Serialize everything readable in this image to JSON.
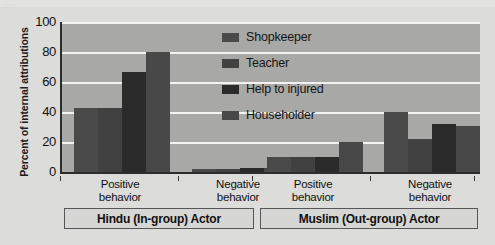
{
  "top_caption_fragment": "     ,       ,            ,                      ",
  "axis": {
    "y_title": "Percent of internal attributions",
    "y_ticks": [
      "100",
      "80",
      "60",
      "40",
      "20",
      "0"
    ]
  },
  "legend": {
    "items": [
      {
        "label": "Shopkeeper",
        "color": "#4a4a4a"
      },
      {
        "label": "Teacher",
        "color": "#414141"
      },
      {
        "label": "Help to injured",
        "color": "#2b2b2b"
      },
      {
        "label": "Householder",
        "color": "#484848"
      }
    ]
  },
  "groups": [
    {
      "name": "Hindu (In-group) Actor",
      "categories": [
        "Positive|behavior",
        "Negative|behavior"
      ]
    },
    {
      "name": "Muslim (Out-group) Actor",
      "categories": [
        "Positive|behavior",
        "Negative|behavior"
      ]
    }
  ],
  "x_category_labels": [
    {
      "line1": "Positive",
      "line2": "behavior"
    },
    {
      "line1": "Negative",
      "line2": "behavior"
    },
    {
      "line1": "Positive",
      "line2": "behavior"
    },
    {
      "line1": "Negative",
      "line2": "behavior"
    }
  ],
  "group_box_labels": [
    "Hindu (In-group) Actor",
    "Muslim (Out-group) Actor"
  ],
  "colors": {
    "plot_background": "#a8a8a6",
    "figure_background": "#dcdcda",
    "gridline": "#f3f3f1",
    "axis_line": "#2c2c2c",
    "text": "#111111"
  },
  "chart_data": {
    "type": "bar",
    "title": "",
    "xlabel": "",
    "ylabel": "Percent of internal attributions",
    "ylim": [
      0,
      100
    ],
    "yticks": [
      0,
      20,
      40,
      60,
      80,
      100
    ],
    "grid": true,
    "legend_position": "inside-top-center",
    "categories": [
      "Hindu (In-group) Actor / Positive behavior",
      "Hindu (In-group) Actor / Negative behavior",
      "Muslim (Out-group) Actor / Positive behavior",
      "Muslim (Out-group) Actor / Negative behavior"
    ],
    "series": [
      {
        "name": "Shopkeeper",
        "values": [
          43,
          2,
          10,
          40
        ]
      },
      {
        "name": "Teacher",
        "values": [
          43,
          2,
          10,
          22
        ]
      },
      {
        "name": "Help to injured",
        "values": [
          67,
          3,
          10,
          32
        ]
      },
      {
        "name": "Householder",
        "values": [
          80,
          3,
          20,
          31
        ]
      }
    ]
  }
}
